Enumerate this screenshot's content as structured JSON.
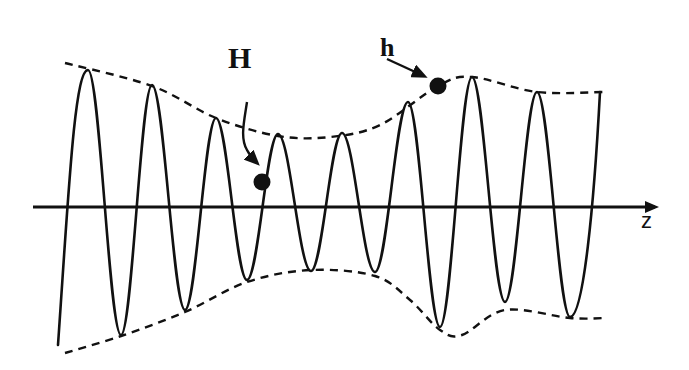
{
  "diagram": {
    "axis": {
      "label": "z",
      "y": 207,
      "x_start": 33,
      "x_end": 658
    },
    "labels": {
      "H": "H",
      "h": "h"
    },
    "markers": [
      {
        "id": "H",
        "label": "H",
        "dot": {
          "x": 262,
          "y": 182
        },
        "label_pos": {
          "x": 228,
          "y": 68
        }
      },
      {
        "id": "h",
        "label": "h",
        "dot": {
          "x": 438,
          "y": 86
        },
        "label_pos": {
          "x": 380,
          "y": 56
        }
      }
    ],
    "wave": {
      "start": {
        "x": 58,
        "y": 345
      },
      "end": {
        "x": 600,
        "y": 92
      },
      "peaks": [
        {
          "x": 88,
          "y": 70
        },
        {
          "x": 152,
          "y": 85
        },
        {
          "x": 216,
          "y": 118
        },
        {
          "x": 278,
          "y": 134
        },
        {
          "x": 342,
          "y": 133
        },
        {
          "x": 408,
          "y": 102
        },
        {
          "x": 472,
          "y": 77
        },
        {
          "x": 537,
          "y": 92
        }
      ],
      "troughs": [
        {
          "x": 121,
          "y": 335
        },
        {
          "x": 185,
          "y": 310
        },
        {
          "x": 247,
          "y": 280
        },
        {
          "x": 311,
          "y": 271
        },
        {
          "x": 375,
          "y": 272
        },
        {
          "x": 440,
          "y": 327
        },
        {
          "x": 505,
          "y": 302
        },
        {
          "x": 570,
          "y": 317
        }
      ]
    },
    "upper_envelope": [
      {
        "x": 65,
        "y": 63
      },
      {
        "x": 152,
        "y": 86
      },
      {
        "x": 216,
        "y": 118
      },
      {
        "x": 278,
        "y": 136
      },
      {
        "x": 330,
        "y": 137
      },
      {
        "x": 380,
        "y": 125
      },
      {
        "x": 438,
        "y": 86
      },
      {
        "x": 472,
        "y": 77
      },
      {
        "x": 537,
        "y": 92
      },
      {
        "x": 605,
        "y": 92
      }
    ],
    "lower_envelope": [
      {
        "x": 65,
        "y": 353
      },
      {
        "x": 121,
        "y": 336
      },
      {
        "x": 185,
        "y": 312
      },
      {
        "x": 247,
        "y": 282
      },
      {
        "x": 311,
        "y": 270
      },
      {
        "x": 375,
        "y": 276
      },
      {
        "x": 410,
        "y": 300
      },
      {
        "x": 440,
        "y": 330
      },
      {
        "x": 462,
        "y": 335
      },
      {
        "x": 505,
        "y": 310
      },
      {
        "x": 570,
        "y": 318
      },
      {
        "x": 605,
        "y": 318
      }
    ],
    "colors": {
      "ink": "#111111",
      "background": "#ffffff"
    }
  }
}
